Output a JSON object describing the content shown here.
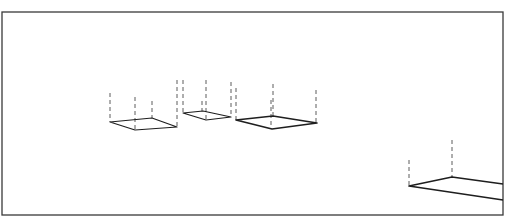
{
  "figure": {
    "colors": {
      "background": "#ffffff",
      "line": "#1e1e1e",
      "dashed_edge": "#4a4a4a",
      "frame": "#3a3a3a"
    },
    "frame": {
      "x": 2,
      "y": 12,
      "width": 501,
      "height": 203
    },
    "boxes": [
      {
        "id": "box-1",
        "base": [
          [
            110,
            122
          ],
          [
            135,
            130
          ],
          [
            177,
            127
          ],
          [
            152,
            118
          ]
        ],
        "verticals": [
          {
            "x": 110,
            "y1": 93,
            "y2": 122
          },
          {
            "x": 135,
            "y1": 97,
            "y2": 130
          },
          {
            "x": 152,
            "y1": 101,
            "y2": 118
          },
          {
            "x": 177,
            "y1": 80,
            "y2": 127
          }
        ]
      },
      {
        "id": "box-2",
        "base": [
          [
            183,
            113
          ],
          [
            206,
            120
          ],
          [
            231,
            117
          ],
          [
            203,
            111
          ]
        ],
        "verticals": [
          {
            "x": 183,
            "y1": 80,
            "y2": 113
          },
          {
            "x": 202,
            "y1": 101,
            "y2": 111
          },
          {
            "x": 206,
            "y1": 80,
            "y2": 120
          },
          {
            "x": 231,
            "y1": 82,
            "y2": 117
          }
        ]
      },
      {
        "id": "box-3",
        "base": [
          [
            236,
            120
          ],
          [
            272,
            129
          ],
          [
            317,
            123
          ],
          [
            273,
            116
          ]
        ],
        "verticals": [
          {
            "x": 236,
            "y1": 88,
            "y2": 120
          },
          {
            "x": 271,
            "y1": 100,
            "y2": 128
          },
          {
            "x": 273,
            "y1": 84,
            "y2": 116
          },
          {
            "x": 316,
            "y1": 90,
            "y2": 123
          }
        ]
      },
      {
        "id": "box-4",
        "base_open": [
          [
            503,
            184
          ],
          [
            452,
            177
          ],
          [
            409,
            186
          ],
          [
            503,
            200
          ]
        ],
        "verticals": [
          {
            "x": 409,
            "y1": 160,
            "y2": 186
          },
          {
            "x": 452,
            "y1": 140,
            "y2": 177
          }
        ]
      }
    ]
  }
}
